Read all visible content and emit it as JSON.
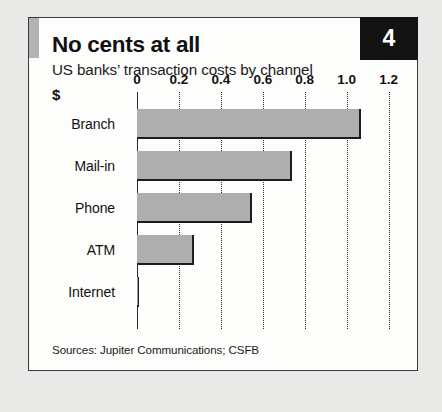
{
  "card": {
    "badge_number": "4",
    "title": "No cents at all",
    "subtitle": "US banks’ transaction costs by channel",
    "unit_label": "$",
    "source_note": "Sources: Jupiter Communications; CSFB"
  },
  "colors": {
    "bar_fill": "#aeaeae",
    "bar_edge": "#1d1d1d",
    "badge_background": "#131313",
    "badge_text": "#ffffff",
    "accent_block": "#b3b3b3",
    "card_background": "#fdfdfc",
    "page_background": "#e9e9e7",
    "frame_border": "#3a3a3a"
  },
  "chart_data": {
    "type": "bar",
    "orientation": "horizontal",
    "title": "No cents at all",
    "subtitle": "US banks’ transaction costs by channel",
    "xlabel": "$",
    "ylabel": "",
    "categories": [
      "Branch",
      "Mail-in",
      "Phone",
      "ATM",
      "Internet"
    ],
    "values": [
      1.07,
      0.74,
      0.55,
      0.27,
      0.01
    ],
    "series": [
      {
        "name": "Transaction cost",
        "values": [
          1.07,
          0.74,
          0.55,
          0.27,
          0.01
        ]
      }
    ],
    "xlim": [
      0,
      1.24
    ],
    "xticks": [
      0,
      0.2,
      0.4,
      0.6,
      0.8,
      1.0,
      1.2
    ],
    "xtick_labels": [
      "0",
      "0.2",
      "0.4",
      "0.6",
      "0.8",
      "1.0",
      "1.2"
    ],
    "grid": "vertical-dotted",
    "legend": "none",
    "annotations": [
      "Sources: Jupiter Communications; CSFB"
    ]
  }
}
